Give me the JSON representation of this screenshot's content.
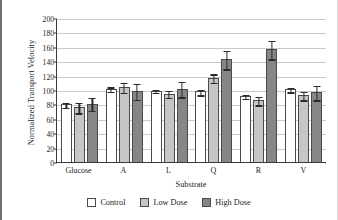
{
  "chart_data": {
    "type": "bar",
    "title": "",
    "xlabel": "Substrate",
    "ylabel": "Normalized Transport Velocity",
    "categories": [
      "Glucose",
      "A",
      "L",
      "Q",
      "R",
      "V"
    ],
    "ylim": [
      0,
      200
    ],
    "yticks": [
      0,
      20,
      40,
      60,
      80,
      100,
      120,
      140,
      160,
      180,
      200
    ],
    "grid": true,
    "legend_position": "bottom",
    "series": [
      {
        "name": "Control",
        "color": "#ffffff",
        "values": [
          80,
          102,
          99,
          98,
          92,
          101
        ],
        "errors": [
          4,
          3,
          2,
          4,
          3,
          3
        ]
      },
      {
        "name": "Low Dose",
        "color": "#c6c6c6",
        "values": [
          76,
          104,
          95,
          117,
          86,
          93
        ],
        "errors": [
          7,
          7,
          5,
          6,
          6,
          6
        ]
      },
      {
        "name": "High Dose",
        "color": "#868686",
        "values": [
          81,
          99,
          102,
          143,
          157,
          97
        ],
        "errors": [
          9,
          11,
          11,
          13,
          13,
          10
        ]
      }
    ]
  },
  "legend": {
    "items": [
      {
        "label": "Control",
        "key": "control"
      },
      {
        "label": "Low Dose",
        "key": "low"
      },
      {
        "label": "High Dose",
        "key": "high"
      }
    ]
  }
}
